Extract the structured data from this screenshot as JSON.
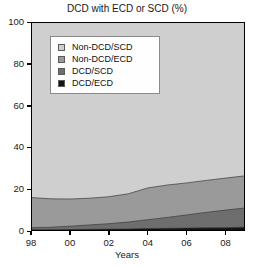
{
  "chart_data": {
    "type": "area",
    "title": "DCD with ECD or SCD (%)",
    "xlabel": "Years",
    "ylabel": "",
    "stacked": true,
    "grid": true,
    "legend_position": "upper-left-inside",
    "xlim": [
      1998,
      2009
    ],
    "ylim": [
      0,
      100
    ],
    "yticks": [
      0,
      20,
      40,
      60,
      80,
      100
    ],
    "ytick_labels": [
      "0",
      "20",
      "40",
      "60",
      "80",
      "100"
    ],
    "xticks": [
      1998,
      2000,
      2002,
      2004,
      2006,
      2008
    ],
    "xtick_labels": [
      "98",
      "00",
      "02",
      "04",
      "06",
      "08"
    ],
    "x": [
      1998,
      1999,
      2000,
      2001,
      2002,
      2003,
      2004,
      2005,
      2006,
      2007,
      2008,
      2009
    ],
    "series": [
      {
        "name": "DCD/ECD",
        "color": "#141414",
        "values": [
          0.6,
          0.6,
          0.7,
          0.8,
          0.9,
          1.0,
          1.2,
          1.3,
          1.4,
          1.5,
          1.6,
          1.8
        ]
      },
      {
        "name": "DCD/SCD",
        "color": "#6e6e6e",
        "values": [
          1.0,
          1.2,
          1.6,
          2.1,
          2.6,
          3.3,
          4.2,
          5.2,
          6.3,
          7.4,
          8.4,
          9.2
        ]
      },
      {
        "name": "Non-DCD/ECD",
        "color": "#9a9a9a",
        "values": [
          14.4,
          13.6,
          13.0,
          12.8,
          12.9,
          13.5,
          15.2,
          15.5,
          15.3,
          15.3,
          15.3,
          15.4
        ]
      },
      {
        "name": "Non-DCD/SCD",
        "color": "#cfcfcf",
        "values": [
          84.0,
          84.6,
          84.7,
          84.3,
          83.6,
          82.2,
          79.4,
          78.0,
          77.0,
          75.8,
          74.7,
          73.6
        ]
      }
    ],
    "cumulative_top_boundaries": {
      "DCD/ECD": [
        0.6,
        0.6,
        0.7,
        0.8,
        0.9,
        1.0,
        1.2,
        1.3,
        1.4,
        1.5,
        1.6,
        1.8
      ],
      "DCD/SCD": [
        1.6,
        1.8,
        2.3,
        2.9,
        3.5,
        4.3,
        5.4,
        6.5,
        7.7,
        8.9,
        10.0,
        11.0
      ],
      "Non-DCD/ECD": [
        16.0,
        15.4,
        15.3,
        15.7,
        16.4,
        17.8,
        20.6,
        22.0,
        23.0,
        24.2,
        25.3,
        26.4
      ],
      "Non-DCD/SCD": [
        100,
        100,
        100,
        100,
        100,
        100,
        100,
        100,
        100,
        100,
        100,
        100
      ]
    }
  },
  "legend": {
    "items": [
      {
        "label": "Non-DCD/SCD",
        "color": "#cfcfcf"
      },
      {
        "label": "Non-DCD/ECD",
        "color": "#9a9a9a"
      },
      {
        "label": "DCD/SCD",
        "color": "#6e6e6e"
      },
      {
        "label": "DCD/ECD",
        "color": "#141414"
      }
    ]
  },
  "axis_colors": {
    "gridline": "#ffffff",
    "axis": "#000000",
    "plot_background": "#cfcfcf"
  }
}
